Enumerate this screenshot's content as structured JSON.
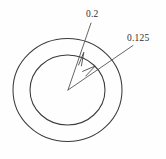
{
  "drawing": {
    "title": "Concentric circles with radial dimension callouts",
    "canvas": {
      "width": 166,
      "height": 159,
      "background_color": "#fefefe"
    },
    "stroke_color": "#3a3a3a",
    "text_color": "#2e2e2e",
    "center": {
      "x": 67.5,
      "y": 90
    },
    "shapes": [
      {
        "name": "outer-circle",
        "type": "ellipse",
        "cx": 67.5,
        "cy": 90,
        "rx": 54.5,
        "ry": 51.5
      },
      {
        "name": "inner-circle",
        "type": "ellipse",
        "cx": 67.5,
        "cy": 90,
        "rx": 37.5,
        "ry": 35.0
      }
    ],
    "callouts": [
      {
        "name": "outer-diameter-callout",
        "label": "0.2",
        "target_shape": "outer-circle",
        "label_x": 86,
        "label_y": 10,
        "leader_from": {
          "x": 68,
          "y": 90
        },
        "leader_arrow_tip": {
          "x": 83.5,
          "y": 52.5
        },
        "leader_to": {
          "x": 91,
          "y": 23
        }
      },
      {
        "name": "inner-diameter-callout",
        "label": "0.125",
        "target_shape": "inner-circle",
        "label_x": 127,
        "label_y": 34,
        "leader_from": {
          "x": 68,
          "y": 90
        },
        "leader_arrow_tip": {
          "x": 94.5,
          "y": 66.5
        },
        "leader_to": {
          "x": 132,
          "y": 45
        }
      }
    ]
  }
}
